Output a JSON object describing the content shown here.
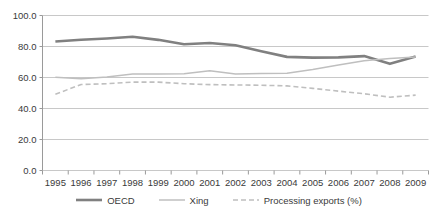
{
  "chart_data": {
    "type": "line",
    "title": "",
    "subtitle": "",
    "xlabel": "",
    "ylabel": "",
    "grid": true,
    "legend_position": "bottom",
    "ylim": [
      0.0,
      100.0
    ],
    "yticks": [
      "0.0",
      "20.0",
      "40.0",
      "60.0",
      "80.0",
      "100.0"
    ],
    "ytick_values": [
      0.0,
      20.0,
      40.0,
      60.0,
      80.0,
      100.0
    ],
    "categories": [
      "1995",
      "1996",
      "1997",
      "1998",
      "1999",
      "2000",
      "2001",
      "2002",
      "2003",
      "2004",
      "2005",
      "2006",
      "2007",
      "2008",
      "2009"
    ],
    "series": [
      {
        "name": "OECD",
        "color": "#808080",
        "style": "solid",
        "width": 2.6,
        "values": [
          83.2,
          84.4,
          85.2,
          86.3,
          84.3,
          81.5,
          82.3,
          80.8,
          77.0,
          73.3,
          72.8,
          73.0,
          73.8,
          68.8,
          73.5
        ]
      },
      {
        "name": "Xing",
        "color": "#bfbfbf",
        "style": "solid",
        "width": 1.5,
        "values": [
          60.2,
          59.2,
          60.4,
          62.3,
          62.2,
          62.5,
          64.3,
          62.3,
          62.6,
          62.8,
          65.2,
          68.0,
          70.8,
          72.2,
          73.2
        ]
      },
      {
        "name": "Processing exports (%)",
        "color": "#bfbfbf",
        "style": "dashed",
        "width": 1.6,
        "values": [
          49.2,
          55.5,
          56.0,
          57.0,
          57.0,
          56.0,
          55.4,
          55.2,
          55.0,
          54.6,
          53.0,
          51.2,
          49.5,
          47.3,
          48.6
        ]
      }
    ]
  },
  "legend": {
    "items": [
      {
        "label": "OECD"
      },
      {
        "label": "Xing"
      },
      {
        "label": "Processing exports (%)"
      }
    ]
  },
  "colors": {
    "series_oecd": "#808080",
    "series_xing": "#bfbfbf",
    "series_processing": "#bfbfbf",
    "gridline": "#c8c8c8",
    "axis": "#9a9a9a",
    "text": "#3a3a3a",
    "background": "#ffffff"
  }
}
